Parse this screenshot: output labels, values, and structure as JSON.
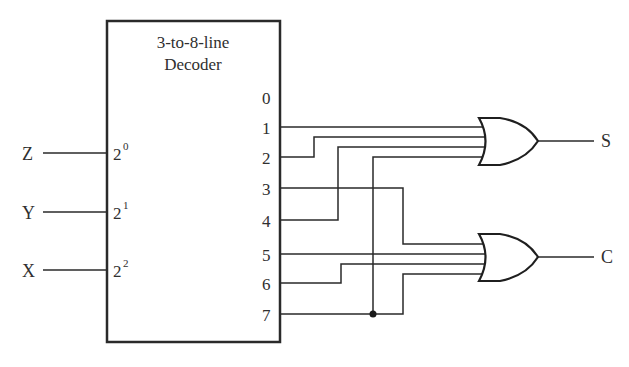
{
  "decoder": {
    "title_line1": "3-to-8-line",
    "title_line2": "Decoder",
    "inputs": [
      {
        "signal": "Z",
        "base": "2",
        "exp": "0"
      },
      {
        "signal": "Y",
        "base": "2",
        "exp": "1"
      },
      {
        "signal": "X",
        "base": "2",
        "exp": "2"
      }
    ],
    "outputs": [
      "0",
      "1",
      "2",
      "3",
      "4",
      "5",
      "6",
      "7"
    ]
  },
  "gates": [
    {
      "type": "OR",
      "output": "S",
      "inputs_from": [
        "1",
        "2",
        "4",
        "7"
      ]
    },
    {
      "type": "OR",
      "output": "C",
      "inputs_from": [
        "3",
        "5",
        "6",
        "7"
      ]
    }
  ],
  "junction": {
    "on_output": "7"
  },
  "colors": {
    "line": "#2a2a2a",
    "background": "#ffffff"
  }
}
